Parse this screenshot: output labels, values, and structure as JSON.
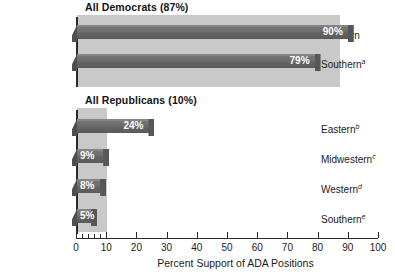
{
  "chart_data": {
    "type": "bar",
    "orientation": "horizontal",
    "title": "",
    "xlabel": "Percent Support of ADA Positions",
    "ylabel": "",
    "xlim": [
      0,
      100
    ],
    "xticks": [
      0,
      10,
      20,
      30,
      40,
      50,
      60,
      70,
      80,
      90,
      100
    ],
    "xtick_labels": [
      "0",
      "10",
      "20",
      "30",
      "40",
      "50",
      "60",
      "70",
      "80",
      "90",
      "100"
    ],
    "minor_xticks": [
      2,
      4,
      6,
      8,
      10
    ],
    "grid": false,
    "legend": null,
    "groups": [
      {
        "id": "democrats",
        "title": "All Democrats (87%)",
        "overall_value": 87,
        "categories": [
          "Northern",
          "Southern"
        ],
        "footnotes": [
          "",
          "a"
        ],
        "values": [
          90,
          79
        ],
        "value_labels": [
          "90%",
          "79%"
        ]
      },
      {
        "id": "republicans",
        "title": "All Republicans (10%)",
        "overall_value": 10,
        "categories": [
          "Eastern",
          "Midwestern",
          "Western",
          "Southern"
        ],
        "footnotes": [
          "b",
          "c",
          "d",
          "e"
        ],
        "values": [
          24,
          9,
          8,
          5
        ],
        "value_labels": [
          "24%",
          "9%",
          "8%",
          "5%"
        ]
      }
    ]
  },
  "groups": {
    "democrats": {
      "title": "All Democrats (87%)",
      "rows": [
        {
          "label": "Northern",
          "footnote": "",
          "value": 90,
          "value_label": "90%"
        },
        {
          "label": "Southern",
          "footnote": "a",
          "value": 79,
          "value_label": "79%"
        }
      ]
    },
    "republicans": {
      "title": "All Republicans (10%)",
      "rows": [
        {
          "label": "Eastern",
          "footnote": "b",
          "value": 24,
          "value_label": "24%"
        },
        {
          "label": "Midwestern",
          "footnote": "c",
          "value": 9,
          "value_label": "9%"
        },
        {
          "label": "Western",
          "footnote": "d",
          "value": 8,
          "value_label": "8%"
        },
        {
          "label": "Southern",
          "footnote": "e",
          "value": 5,
          "value_label": "5%"
        }
      ]
    }
  },
  "axis": {
    "title": "Percent Support of ADA Positions",
    "ticks": [
      "0",
      "10",
      "20",
      "30",
      "40",
      "50",
      "60",
      "70",
      "80",
      "90",
      "100"
    ]
  },
  "colors": {
    "bar_face": "#6e6e6e",
    "bar_shadow": "#4e4e4e",
    "panel": "#c9c9c9",
    "axis": "#2b2b2b",
    "value_text": "#ffffff",
    "background": "#ffffff"
  }
}
